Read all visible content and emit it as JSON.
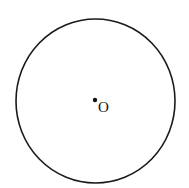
{
  "diagram": {
    "type": "geometry-circle",
    "circle": {
      "cx": 95.5,
      "cy": 101,
      "rx": 79.5,
      "ry": 82,
      "stroke": "#1a1a1a",
      "stroke_width": 1.6
    },
    "center_point": {
      "x": 95,
      "y": 100,
      "r": 2.2,
      "fill": "#111111"
    },
    "labels": [
      {
        "text": "O",
        "x": 98,
        "y": 112
      }
    ]
  }
}
